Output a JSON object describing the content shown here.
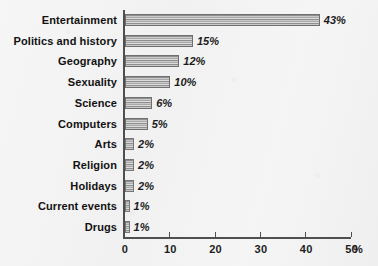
{
  "chart_data": {
    "type": "bar",
    "orientation": "horizontal",
    "title": "",
    "xlabel": "%",
    "ylabel": "",
    "xlim": [
      0,
      50
    ],
    "grid": false,
    "legend": null,
    "x_ticks": [
      "0",
      "10",
      "20",
      "30",
      "40",
      "50"
    ],
    "x_tick_values": [
      0,
      10,
      20,
      30,
      40,
      50
    ],
    "axis_unit": "%",
    "categories": [
      "Entertainment",
      "Politics and history",
      "Geography",
      "Sexuality",
      "Science",
      "Computers",
      "Arts",
      "Religion",
      "Holidays",
      "Current events",
      "Drugs"
    ],
    "values": [
      43,
      15,
      12,
      10,
      6,
      5,
      2,
      2,
      2,
      1,
      1
    ],
    "value_labels": [
      "43%",
      "15%",
      "12%",
      "10%",
      "6%",
      "5%",
      "2%",
      "2%",
      "2%",
      "1%",
      "1%"
    ],
    "colors": {
      "bar_fill_light": "#dcdcdc",
      "bar_fill_dark": "#8f8f8f",
      "bar_border": "#6f6f6f",
      "axis": "#4f4f4f",
      "text": "#1c1c1c",
      "background": "#f3f3f3"
    }
  }
}
